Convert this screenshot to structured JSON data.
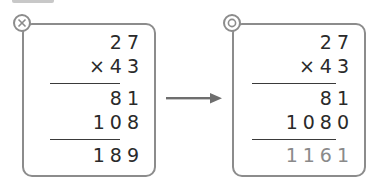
{
  "wrong_example": {
    "mark": "cross",
    "multiplicand": "27",
    "multiplier": "×43",
    "partial_1": "81",
    "partial_2": "108",
    "result": "189"
  },
  "correct_example": {
    "mark": "double-circle",
    "multiplicand": "27",
    "multiplier": "×43",
    "partial_1": "81",
    "partial_2": "1080",
    "result": "1161"
  },
  "colors": {
    "border": "#8c8c8c",
    "text": "#2a2a2a",
    "answer_text": "#8a8a8a",
    "arrow": "#6e6e6e"
  }
}
